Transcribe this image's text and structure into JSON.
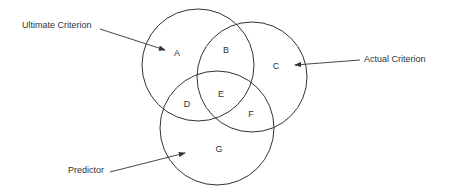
{
  "diagram": {
    "type": "venn",
    "circles": [
      {
        "id": "ultimate",
        "label": "Ultimate Criterion",
        "cx": 198,
        "cy": 65,
        "r": 56
      },
      {
        "id": "actual",
        "label": "Actual Criterion",
        "cx": 252,
        "cy": 77,
        "r": 55
      },
      {
        "id": "predictor",
        "label": "Predictor",
        "cx": 217,
        "cy": 128,
        "r": 57
      }
    ],
    "regions": {
      "A": "A",
      "B": "B",
      "C": "C",
      "D": "D",
      "E": "E",
      "F": "F",
      "G": "G"
    },
    "labels": {
      "ultimate": "Ultimate Criterion",
      "actual": "Actual Criterion",
      "predictor": "Predictor"
    },
    "stroke_color": "#333333"
  }
}
